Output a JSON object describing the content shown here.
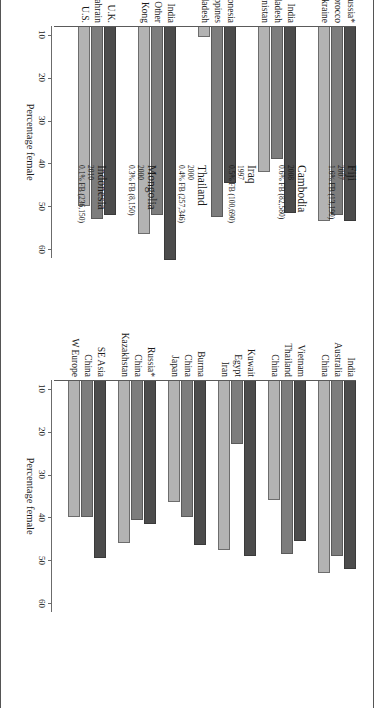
{
  "figure": {
    "axis_title": "Percentage female",
    "ticks": [
      10,
      20,
      30,
      40,
      50,
      60
    ],
    "tick_labels": [
      "10",
      "20",
      "30",
      "40",
      "50",
      "60"
    ],
    "series_colors": [
      "#4c4c4c",
      "#7d7d7d",
      "#b3b3b3"
    ]
  },
  "chart_data": {
    "type": "bar",
    "xlabel": "Percentage female",
    "ylabel": "",
    "xlim": [
      8,
      62
    ],
    "grid": false,
    "legend": "none",
    "orientation": "horizontal",
    "panels": [
      {
        "name": "left-panel",
        "axis_title": "Percentage female",
        "tick_labels": [
          "10",
          "20",
          "30",
          "40",
          "50",
          "60"
        ],
        "groups": [
          {
            "destination": "Israel",
            "year": "1995",
            "share": "32.3% FB (1,795,800)",
            "categories": [
              "Russia*",
              "Morocco",
              "Ukraine"
            ],
            "values": [
              53.5,
              52.0,
              53.5
            ]
          },
          {
            "destination": "Pakistan",
            "year": "1973",
            "share": "9.0% FB (5,465,165)",
            "categories": [
              "India",
              "Bangladesh",
              "Afghanistan"
            ],
            "values": [
              51.5,
              39.0,
              42.0
            ]
          },
          {
            "destination": "Malaysia",
            "year": "2000",
            "share": "6.9% FB (1,504,150)",
            "categories": [
              "Indonesia",
              "Philippines",
              "Bangladesh"
            ],
            "values": [
              44.5,
              52.5,
              10.5
            ]
          },
          {
            "destination": "Nepal",
            "year": "2001",
            "share": "2.6% FB (582,121)",
            "categories": [
              "India",
              "Asia, Other",
              "Hong Kong"
            ],
            "values": [
              62.5,
              52.0,
              56.5
            ]
          },
          {
            "destination": "Philippines",
            "year": "2000",
            "share": "1.7% FB (1,299,990)",
            "categories": [
              "U.K.",
              "Bahrain",
              "U.S."
            ],
            "values": [
              52.0,
              53.0,
              50.0
            ]
          }
        ]
      },
      {
        "name": "right-panel",
        "axis_title": "Percentage female",
        "tick_labels": [
          "10",
          "20",
          "30",
          "40",
          "50",
          "60"
        ],
        "groups": [
          {
            "destination": "Fiji",
            "year": "2007",
            "share": "1.6% FB (13,190)",
            "categories": [
              "India",
              "Australia",
              "China"
            ],
            "values": [
              52.0,
              49.0,
              53.0
            ]
          },
          {
            "destination": "Cambodia",
            "year": "2008",
            "share": "0.6% FB (82,580)",
            "categories": [
              "Vietnam",
              "Thailand",
              "China"
            ],
            "values": [
              45.5,
              48.5,
              36.0
            ]
          },
          {
            "destination": "Iraq",
            "year": "1997",
            "share": "0.5% FB (100,690)",
            "categories": [
              "Kuwait",
              "Egypt",
              "Iran"
            ],
            "values": [
              49.0,
              23.0,
              47.5
            ]
          },
          {
            "destination": "Thailand",
            "year": "2000",
            "share": "0.4% FB (257,346)",
            "categories": [
              "Burma",
              "China",
              "Japan"
            ],
            "values": [
              46.5,
              40.0,
              36.5
            ]
          },
          {
            "destination": "Mongolia",
            "year": "2000",
            "share": "0.3% FB (8,150)",
            "categories": [
              "Russia*",
              "China",
              "Kazakhstan"
            ],
            "values": [
              41.5,
              40.5,
              46.0
            ]
          },
          {
            "destination": "Indonesia",
            "year": "2010",
            "share": "0.1% FB (236,150)",
            "categories": [
              "SE Asia",
              "China",
              "W Europe"
            ],
            "values": [
              49.5,
              40.0,
              40.0
            ]
          }
        ]
      }
    ]
  }
}
